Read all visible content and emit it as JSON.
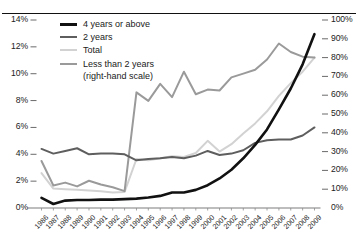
{
  "chart_data": {
    "type": "line",
    "title": "",
    "subtitle": "",
    "xlabel": "",
    "ylabel": "",
    "y2label": "",
    "grid": false,
    "legend_position": "top-left",
    "x": [
      "1986",
      "1987",
      "1988",
      "1989",
      "1990",
      "1991",
      "1992",
      "1993",
      "1994",
      "1995",
      "1996",
      "1997",
      "1998",
      "1999",
      "2000",
      "2001",
      "2002",
      "2003",
      "2004",
      "2005",
      "2006",
      "2007",
      "2008",
      "2009"
    ],
    "left_axis": {
      "ticks": [
        "0%",
        "2%",
        "4%",
        "6%",
        "8%",
        "10%",
        "12%",
        "14%"
      ],
      "values": [
        0,
        2,
        4,
        6,
        8,
        10,
        12,
        14
      ],
      "ylim": [
        0,
        14
      ]
    },
    "right_axis": {
      "ticks": [
        "0%",
        "10%",
        "20%",
        "30%",
        "40%",
        "50%",
        "60%",
        "70%",
        "80%",
        "90%",
        "100%"
      ],
      "values": [
        0,
        10,
        20,
        30,
        40,
        50,
        60,
        70,
        80,
        90,
        100
      ],
      "ylim": [
        0,
        100
      ]
    },
    "series": [
      {
        "name": "4 years or above",
        "axis": "left",
        "color": "#111111",
        "width": 2.6,
        "values": [
          0.75,
          0.3,
          0.55,
          0.6,
          0.6,
          0.62,
          0.62,
          0.66,
          0.7,
          0.78,
          0.9,
          1.15,
          1.15,
          1.35,
          1.7,
          2.2,
          2.85,
          3.7,
          4.7,
          5.85,
          7.35,
          8.9,
          10.7,
          12.95
        ]
      },
      {
        "name": "2 years",
        "axis": "left",
        "color": "#5e5e5e",
        "width": 2.0,
        "values": [
          4.4,
          4.05,
          4.25,
          4.45,
          4.0,
          4.05,
          4.05,
          4.0,
          3.55,
          3.65,
          3.7,
          3.8,
          3.7,
          3.9,
          4.25,
          3.95,
          4.05,
          4.3,
          4.85,
          5.05,
          5.1,
          5.1,
          5.4,
          6.0
        ]
      },
      {
        "name": "Total",
        "axis": "left",
        "color": "#d2d2d2",
        "width": 2.0,
        "values": [
          2.6,
          1.45,
          1.4,
          1.35,
          1.3,
          1.25,
          1.15,
          1.2,
          3.65,
          3.55,
          3.7,
          3.85,
          3.8,
          4.1,
          5.0,
          4.2,
          4.75,
          5.55,
          6.3,
          7.2,
          8.35,
          9.3,
          10.15,
          11.2
        ]
      },
      {
        "name": "Less than 2 years",
        "axis": "right",
        "color": "#9a9a9a",
        "width": 2.0,
        "note": "(right-hand scale)",
        "values": [
          25.0,
          12.0,
          13.5,
          11.5,
          14.5,
          12.5,
          11.0,
          9.0,
          61.5,
          57.0,
          66.0,
          59.0,
          72.5,
          60.5,
          63.0,
          62.5,
          69.5,
          71.5,
          73.5,
          79.0,
          87.5,
          83.0,
          80.5,
          80.0
        ]
      }
    ]
  },
  "legend": {
    "items": [
      {
        "label": "4 years or above",
        "sub": ""
      },
      {
        "label": "2 years",
        "sub": ""
      },
      {
        "label": "Total",
        "sub": ""
      },
      {
        "label": "Less than 2 years",
        "sub": "(right-hand scale)"
      }
    ]
  }
}
